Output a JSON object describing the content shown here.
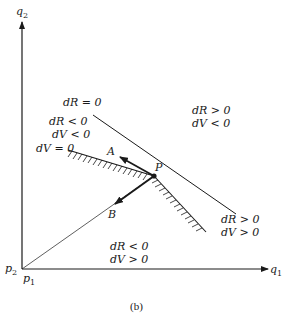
{
  "figure": {
    "caption": "(b)",
    "axes": {
      "x_label": "q",
      "x_sub": "1",
      "y_label": "q",
      "y_sub": "2",
      "origin_x_label": "p",
      "origin_x_sub": "1",
      "origin_y_label": "p",
      "origin_y_sub": "2"
    },
    "lines": {
      "dR_zero": "dR = 0",
      "dV_zero": "dV = 0"
    },
    "points": {
      "P": "P",
      "A": "A",
      "B": "B"
    },
    "regions": {
      "upper_left_line1": "dR < 0",
      "upper_left_line2": "dV < 0",
      "upper_right_line1": "dR > 0",
      "upper_right_line2": "dV < 0",
      "lower_right_line1": "dR > 0",
      "lower_right_line2": "dV > 0",
      "lower_left_line1": "dR < 0",
      "lower_left_line2": "dV > 0"
    }
  }
}
